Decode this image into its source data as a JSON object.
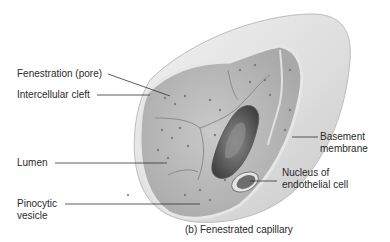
{
  "figure": {
    "caption": "(b) Fenestrated capillary",
    "labels": {
      "fenestration": "Fenestration (pore)",
      "cleft": "Intercellular cleft",
      "lumen": "Lumen",
      "pinocytic_1": "Pinocytic",
      "pinocytic_2": "vesicle",
      "basement_1": "Basement",
      "basement_2": "membrane",
      "nucleus_1": "Nucleus of",
      "nucleus_2": "endothelial cell"
    }
  }
}
